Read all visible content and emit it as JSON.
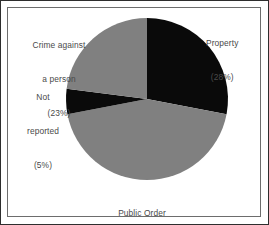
{
  "figure": {
    "background_color": "#ffffff",
    "outer_border_color": "#2e2e2e",
    "inner_border_color": "#6d6d6d"
  },
  "chart_data": {
    "type": "pie",
    "title": "",
    "subtitle": "",
    "xlabel": "",
    "ylabel": "",
    "grid": false,
    "legend_position": "none",
    "labels_position": "outside-callout",
    "start_angle_deg": 0,
    "direction": "clockwise",
    "center_px": [
      146,
      98
    ],
    "radius_px": 81,
    "categories": [
      "Property",
      "Public Order",
      "Not reported",
      "Crime against a person"
    ],
    "values": [
      28,
      44,
      5,
      23
    ],
    "value_unit": "percent",
    "colors": [
      "#0a0a0a",
      "#808080",
      "#0a0a0a",
      "#808080"
    ],
    "slices": [
      {
        "name": "Property",
        "value": 28,
        "percent_text": "(28%)",
        "color": "#0a0a0a",
        "start_deg": 0,
        "end_deg": 100.8
      },
      {
        "name": "Public Order",
        "value": 44,
        "percent_text": "(44%)",
        "color": "#808080",
        "start_deg": 100.8,
        "end_deg": 259.2
      },
      {
        "name": "Not reported",
        "value": 5,
        "percent_text": "(5%)",
        "color": "#0a0a0a",
        "start_deg": 259.2,
        "end_deg": 277.2
      },
      {
        "name": "Crime against a person",
        "value": 23,
        "percent_text": "(23%)",
        "color": "#808080",
        "start_deg": 277.2,
        "end_deg": 360
      }
    ]
  },
  "labels": {
    "property": {
      "line1": "Property",
      "line2": "(28%)"
    },
    "crime_against_person": {
      "line1": "Crime against",
      "line2": "a person",
      "line3": "(23%)"
    },
    "not_reported": {
      "line1": "Not",
      "line2": "reported",
      "line3": "(5%)"
    },
    "public_order": {
      "line1": "Public Order",
      "line2": "(44%)"
    }
  }
}
